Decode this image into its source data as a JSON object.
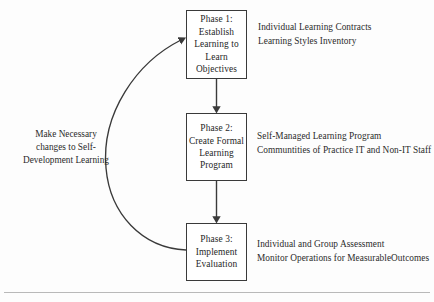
{
  "diagram": {
    "colors": {
      "background": "#fdfdfd",
      "box_border": "#3a3a3a",
      "box_fill": "#ffffff",
      "connector": "#3a3a3a",
      "text": "#2b2b2b",
      "rule": "#b9b9b9"
    },
    "phases": [
      {
        "id": "phase-1",
        "box_lines": [
          "Phase 1:",
          "Establish",
          "Learning to",
          "Learn",
          "Objectives"
        ],
        "annotation_lines": [
          "Individual Learning Contracts",
          "Learning Styles Inventory"
        ]
      },
      {
        "id": "phase-2",
        "box_lines": [
          "Phase 2:",
          "Create Formal",
          "Learning",
          "Program"
        ],
        "annotation_lines": [
          "Self-Managed Learning Program",
          "Communtities of Practice IT and Non-IT Staff"
        ]
      },
      {
        "id": "phase-3",
        "box_lines": [
          "Phase 3:",
          "Implement",
          "Evaluation"
        ],
        "annotation_lines": [
          "Individual and Group Assessment",
          "Monitor Operations for MeasurableOutcomes"
        ]
      }
    ],
    "feedback": {
      "lines": [
        "Make Necessary",
        "changes to Self-",
        "Development Learning"
      ]
    },
    "connectors": [
      {
        "name": "phase-1-to-phase-2",
        "type": "straight-arrow-down"
      },
      {
        "name": "phase-2-to-phase-3",
        "type": "straight-arrow-down"
      },
      {
        "name": "phase-3-to-phase-1-feedback",
        "type": "curved-arrow-up"
      }
    ]
  }
}
